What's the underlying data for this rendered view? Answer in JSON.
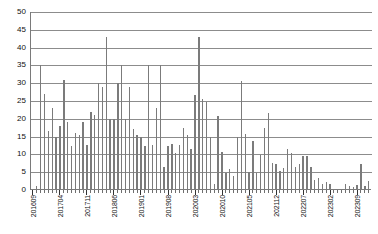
{
  "chart_data": {
    "type": "bar",
    "title": "",
    "xlabel": "",
    "ylabel": "",
    "ylim": [
      0,
      50
    ],
    "ytick_step": 5,
    "yticks": [
      50,
      45,
      40,
      35,
      30,
      25,
      20,
      15,
      10,
      5,
      0
    ],
    "grid": true,
    "legend": false,
    "bar_color": "#7b7b7b",
    "axis_color": "#7a7a7a",
    "gridline_color": "#8c8c8c",
    "xtick_label_rotation": -90,
    "xtick_label_interval_months": 7,
    "xtick_labels_shown": [
      "201609",
      "201704",
      "201711",
      "201806",
      "201901",
      "201908",
      "202003",
      "202010",
      "202105",
      "202112",
      "202207",
      "202302",
      "202309"
    ],
    "categories": [
      "201609",
      "201610",
      "201611",
      "201612",
      "201701",
      "201702",
      "201703",
      "201704",
      "201705",
      "201706",
      "201707",
      "201708",
      "201709",
      "201710",
      "201711",
      "201712",
      "201801",
      "201802",
      "201803",
      "201804",
      "201805",
      "201806",
      "201807",
      "201808",
      "201809",
      "201810",
      "201811",
      "201812",
      "201901",
      "201902",
      "201903",
      "201904",
      "201905",
      "201906",
      "201907",
      "201908",
      "201909",
      "201910",
      "201911",
      "201912",
      "202001",
      "202002",
      "202003",
      "202004",
      "202005",
      "202006",
      "202007",
      "202008",
      "202009",
      "202010",
      "202011",
      "202012",
      "202101",
      "202102",
      "202103",
      "202104",
      "202105",
      "202106",
      "202107",
      "202108",
      "202109",
      "202110",
      "202111",
      "202112",
      "202201",
      "202202",
      "202203",
      "202204",
      "202205",
      "202206",
      "202207",
      "202208",
      "202209",
      "202210",
      "202211",
      "202212",
      "202301",
      "202302",
      "202303",
      "202304",
      "202305",
      "202306",
      "202307",
      "202308",
      "202309",
      "202310",
      "202311",
      "202312"
    ],
    "values": [
      0.4,
      1.2,
      35,
      27,
      16.5,
      23,
      15,
      18,
      31,
      19,
      12.5,
      16,
      15.5,
      19,
      12.7,
      22,
      21,
      30,
      29,
      43,
      20,
      20,
      30,
      35,
      20,
      29,
      17,
      15.5,
      15,
      12.5,
      35,
      12.7,
      23,
      35,
      6.6,
      12.3,
      13,
      10.5,
      12.7,
      17.5,
      15.5,
      11.5,
      26.7,
      43,
      25.7,
      24.8,
      14.8,
      1.8,
      20.8,
      10.8,
      4.8,
      5.8,
      3.8,
      14.8,
      30.5,
      15.7,
      5.2,
      13.7,
      4.8,
      9.8,
      17.5,
      21.5,
      7.5,
      7.2,
      5.4,
      6.3,
      11.5,
      10.5,
      6.4,
      7.3,
      9.6,
      9.5,
      6.5,
      2.7,
      3.5,
      1.8,
      2.2,
      1.8,
      0.3,
      0.2,
      0.3,
      1.7,
      1.2,
      0.9,
      1.3,
      7.2,
      1.2,
      2.4
    ]
  }
}
